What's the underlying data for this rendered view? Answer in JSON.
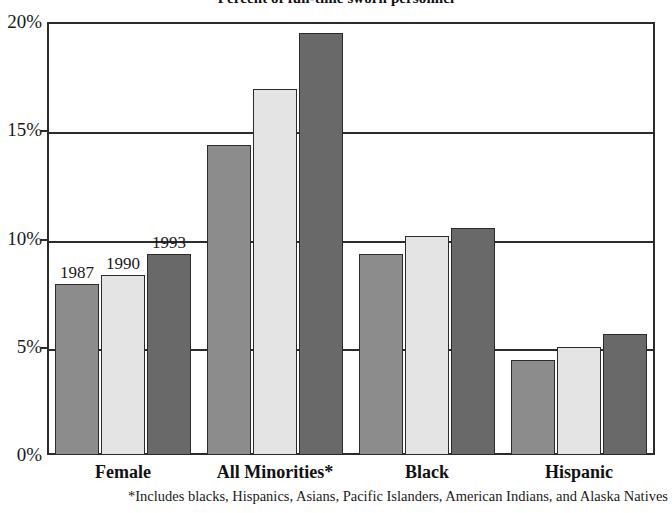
{
  "chart_data": {
    "type": "bar",
    "title": "Percent of full-time sworn personnel",
    "xlabel": "",
    "ylabel": "",
    "ylim": [
      0,
      20
    ],
    "grid": true,
    "legend_position": "inline-data-labels",
    "categories": [
      "Female",
      "All Minorities*",
      "Black",
      "Hispanic"
    ],
    "series": [
      {
        "name": "1987",
        "color": "#8c8c8c",
        "values": [
          7.9,
          14.3,
          9.3,
          4.4
        ]
      },
      {
        "name": "1990",
        "color": "#e4e4e4",
        "values": [
          8.3,
          16.9,
          10.1,
          5.0
        ]
      },
      {
        "name": "1993",
        "color": "#696969",
        "values": [
          9.3,
          19.5,
          10.5,
          5.6
        ]
      }
    ],
    "ytick_labels": [
      "0%",
      "5%",
      "10%",
      "15%",
      "20%"
    ],
    "ytick_values": [
      0,
      5,
      10,
      15,
      20
    ],
    "annotations": [
      "1987",
      "1990",
      "1993"
    ],
    "footnote": "*Includes blacks, Hispanics, Asians, Pacific Islanders, American Indians, and Alaska Natives"
  },
  "axis": {
    "y_labels": [
      {
        "text": "20%",
        "value": 20
      },
      {
        "text": "15%",
        "value": 15
      },
      {
        "text": "10%",
        "value": 10
      },
      {
        "text": "5%",
        "value": 5
      },
      {
        "text": "0%",
        "value": 0
      }
    ]
  },
  "x_categories": [
    {
      "label": "Female"
    },
    {
      "label": "All Minorities*"
    },
    {
      "label": "Black"
    },
    {
      "label": "Hispanic"
    }
  ],
  "data_labels": [
    {
      "text": "1987"
    },
    {
      "text": "1990"
    },
    {
      "text": "1993"
    }
  ],
  "footnote_text": "*Includes blacks, Hispanics, Asians, Pacific Islanders, American Indians, and Alaska Natives",
  "title_text": "Percent of full-time sworn personnel"
}
